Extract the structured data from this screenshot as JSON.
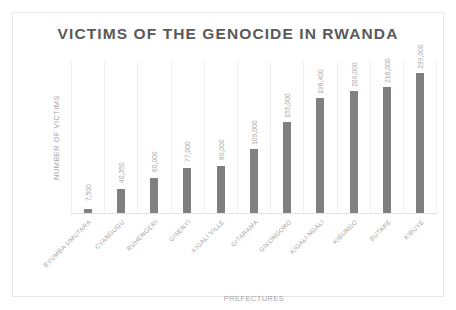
{
  "chart_data": {
    "type": "bar",
    "title": "VICTIMS OF THE GENOCIDE IN RWANDA",
    "xlabel": "PREFECTURES",
    "ylabel": "NUMBER OF VICTIMS",
    "categories": [
      "BYUMBA-UMUTARA",
      "CYANGUGU",
      "RUHENGERI",
      "GISENYI",
      "KIGALI VILLE",
      "GITARAMA",
      "GIKONGORO",
      "KIGALI NGALI",
      "KIBUNGO",
      "BUTARE",
      "KIBUYE"
    ],
    "values": [
      7500,
      40350,
      60000,
      77000,
      80000,
      109000,
      155000,
      196400,
      209000,
      216000,
      239000
    ],
    "value_labels": [
      "7,500",
      "40,350",
      "60,000",
      "77,000",
      "80,000",
      "109,000",
      "155,000",
      "196,400",
      "209,000",
      "216,000",
      "239,000"
    ],
    "ylim": [
      0,
      260000
    ],
    "grid": "vertical-category-separators",
    "legend": "none",
    "bar_color": "#808080",
    "title_color": "#595959",
    "label_color": "#a6a6a6"
  }
}
